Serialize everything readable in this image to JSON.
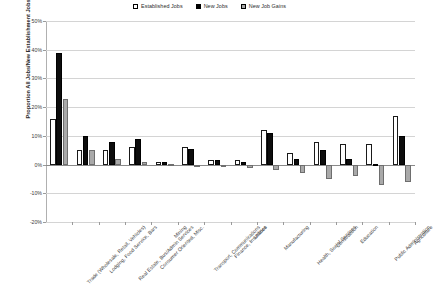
{
  "chart_data": {
    "type": "bar",
    "title": "",
    "xlabel": "",
    "ylabel": "Proportion All Jobs/New Establishment Jobs",
    "ylim": [
      -20,
      50
    ],
    "ytick_labels": [
      "50%",
      "40%",
      "30%",
      "20%",
      "10%",
      "0%",
      "-10%",
      "-20%"
    ],
    "ytick_values": [
      50,
      40,
      30,
      20,
      10,
      0,
      -10,
      -20
    ],
    "grid": true,
    "legend_position": "top-center",
    "categories": [
      "Trade (Wholesale, Retail, Vehicles)",
      "Lodging, Food Service, Bars",
      "Real Estate, Bus/Admin Services",
      "Consumer Oriented, Misc.",
      "Mining",
      "Transport, Communications",
      "Finance, Insurance",
      "Utilities",
      "Manufacturing",
      "Health, Social Services",
      "Construction",
      "Education",
      "Public Administration",
      "Agriculture"
    ],
    "series": [
      {
        "name": "Established Jobs",
        "color": "#ffffff",
        "values": [
          16,
          5,
          5,
          6,
          1,
          6,
          1.5,
          1.5,
          12,
          4,
          8,
          7,
          7,
          17
        ]
      },
      {
        "name": "New Jobs",
        "color": "#000000",
        "values": [
          39,
          10,
          8,
          9,
          1,
          5.5,
          1.5,
          1,
          11,
          2,
          5,
          2,
          0.3,
          10
        ]
      },
      {
        "name": "New Job Gains",
        "color": "#a9a9a9",
        "values": [
          23,
          5,
          2,
          1,
          0.3,
          -1,
          -0.8,
          -1.2,
          -2,
          -3,
          -5,
          -4,
          -7,
          -6
        ]
      }
    ]
  },
  "legend": {
    "items": [
      {
        "label": "Established Jobs"
      },
      {
        "label": "New Jobs"
      },
      {
        "label": "New Job Gains"
      }
    ]
  }
}
